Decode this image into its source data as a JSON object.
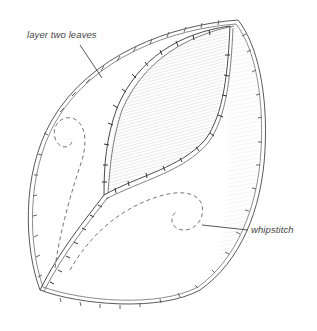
{
  "figure": {
    "labels": {
      "top": "layer two leaves",
      "right": "whipstitch"
    },
    "colors": {
      "background": "#ffffff",
      "pencil": "#555555",
      "shading": "#bdbdbd",
      "label_text": "#444444"
    }
  }
}
